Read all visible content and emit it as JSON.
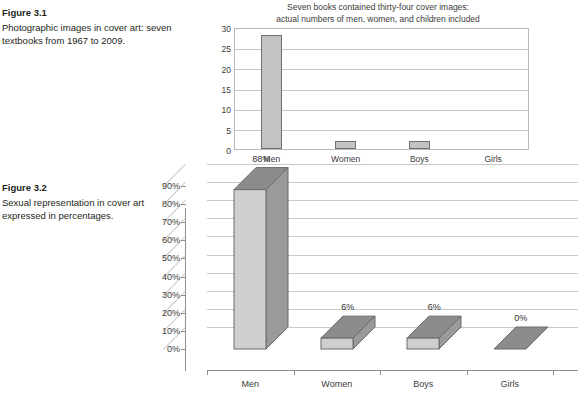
{
  "figures": [
    {
      "label": "Figure 3.1",
      "caption": "Photographic images in cover art: seven textbooks from 1967 to 2009."
    },
    {
      "label": "Figure 3.2",
      "caption": "Sexual representation in cover art expressed in percentages."
    }
  ],
  "chart_data": [
    {
      "type": "bar",
      "title": "Seven books contained thirty-four cover images:\nactual numbers of men, women, and children included",
      "title_line1": "Seven books contained thirty-four cover images:",
      "title_line2": "actual numbers of men, women, and children included",
      "categories": [
        "Men",
        "Women",
        "Boys",
        "Girls"
      ],
      "values": [
        28,
        2,
        2,
        0
      ],
      "yticks": [
        0,
        5,
        10,
        15,
        20,
        25,
        30
      ],
      "yticklabels": [
        "0",
        "5",
        "10",
        "15",
        "20",
        "25",
        "30"
      ],
      "ylim": [
        0,
        30
      ],
      "xlabel": "",
      "ylabel": "",
      "grid": true,
      "legend": "none",
      "bar_fill": "#c3c3c3",
      "bar_stroke": "#6f6f6f"
    },
    {
      "type": "bar",
      "title": "",
      "categories": [
        "Men",
        "Women",
        "Boys",
        "Girls"
      ],
      "values": [
        88,
        6,
        6,
        0
      ],
      "datalabels": [
        "88%",
        "6%",
        "6%",
        "0%"
      ],
      "yticks": [
        0,
        10,
        20,
        30,
        40,
        50,
        60,
        70,
        80,
        90
      ],
      "yticklabels": [
        "0%",
        "10%",
        "20%",
        "30%",
        "40%",
        "50%",
        "60%",
        "70%",
        "80%",
        "90%"
      ],
      "ylim": [
        0,
        90
      ],
      "xlabel": "",
      "ylabel": "",
      "grid": true,
      "legend": "none",
      "style": "3d",
      "bar_front": "#cfcfcf",
      "bar_side": "#9a9a9a",
      "bar_top": "#8c8c8c",
      "bar_stroke": "#6a6a6a"
    }
  ]
}
